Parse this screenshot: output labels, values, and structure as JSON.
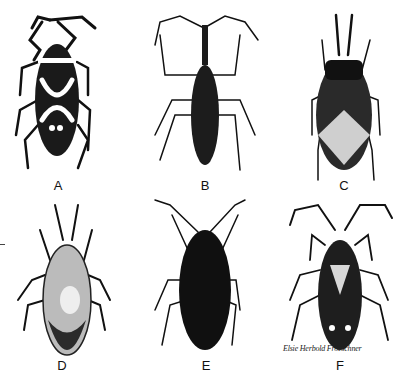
{
  "figure": {
    "panels": [
      {
        "label": "A",
        "body_color": "#1a1a1a",
        "pattern": "dark body with white X-shaped band and two white spots"
      },
      {
        "label": "B",
        "body_color": "#1c1c1c",
        "pattern": "slender dark body with long neck and thin legs"
      },
      {
        "label": "C",
        "body_color": "#2a2a2a",
        "pattern": "broad body with pale diamond on wings"
      },
      {
        "label": "D",
        "body_color": "#2b2b2b",
        "pattern": "mottled body with dark tip"
      },
      {
        "label": "E",
        "body_color": "#101010",
        "pattern": "uniform black oval body"
      },
      {
        "label": "F",
        "body_color": "#1e1e1e",
        "pattern": "dark body with pale triangle and two white spots"
      }
    ],
    "signature": "Elsie Herbold Froeschner"
  }
}
